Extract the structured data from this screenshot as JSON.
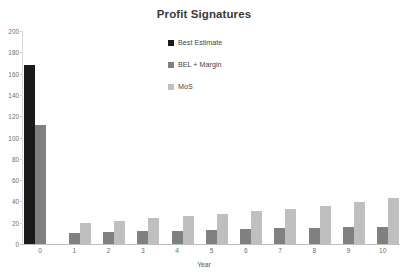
{
  "chart_data": {
    "type": "bar",
    "title": "Profit Signatures",
    "xlabel": "Year",
    "ylabel": "",
    "categories": [
      "0",
      "1",
      "2",
      "3",
      "4",
      "5",
      "6",
      "7",
      "8",
      "9",
      "10"
    ],
    "series": [
      {
        "name": "Best Estimate",
        "color": "#1a1a1a",
        "values": [
          168,
          0,
          0,
          0,
          0,
          0,
          0,
          0,
          0,
          0,
          0
        ]
      },
      {
        "name": "BEL + Margin",
        "color": "#808080",
        "values": [
          112,
          10,
          11,
          12,
          12,
          13,
          14,
          15,
          15,
          16,
          16
        ]
      },
      {
        "name": "MoS",
        "color": "#bfbfbf",
        "values": [
          0,
          20,
          22,
          24,
          26,
          28,
          31,
          33,
          36,
          39,
          43
        ]
      }
    ],
    "ylim": [
      0,
      200
    ],
    "yticks": [
      0,
      20,
      40,
      60,
      80,
      100,
      120,
      140,
      160,
      180,
      200
    ],
    "grid": false,
    "legend_position": "top-center"
  }
}
